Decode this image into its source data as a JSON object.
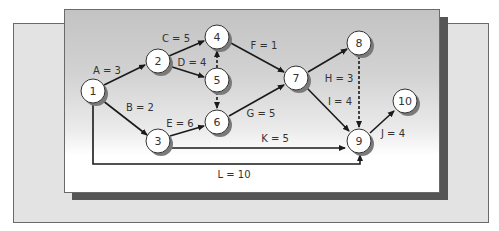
{
  "diagram": {
    "type": "activity-on-arrow network",
    "colors": {
      "front_panel_top": "#c3c3c3",
      "front_panel_bottom": "#ffffff",
      "back_panel": "#e3e3e3",
      "shadow": "#555555",
      "edge": "#1a1a1a"
    },
    "nodes": [
      {
        "id": "1",
        "label": "1",
        "x": 93,
        "y": 91
      },
      {
        "id": "2",
        "label": "2",
        "x": 158,
        "y": 61
      },
      {
        "id": "3",
        "label": "3",
        "x": 158,
        "y": 141
      },
      {
        "id": "4",
        "label": "4",
        "x": 217,
        "y": 37
      },
      {
        "id": "5",
        "label": "5",
        "x": 217,
        "y": 80
      },
      {
        "id": "6",
        "label": "6",
        "x": 217,
        "y": 122
      },
      {
        "id": "7",
        "label": "7",
        "x": 296,
        "y": 78
      },
      {
        "id": "8",
        "label": "8",
        "x": 359,
        "y": 43
      },
      {
        "id": "9",
        "label": "9",
        "x": 359,
        "y": 141
      },
      {
        "id": "10",
        "label": "10",
        "x": 405,
        "y": 101
      }
    ],
    "activities": [
      {
        "name": "A",
        "duration": 3,
        "label": "A = 3",
        "from": "1",
        "to": "2",
        "dummy": false
      },
      {
        "name": "B",
        "duration": 2,
        "label": "B = 2",
        "from": "1",
        "to": "3",
        "dummy": false
      },
      {
        "name": "C",
        "duration": 5,
        "label": "C = 5",
        "from": "2",
        "to": "4",
        "dummy": false
      },
      {
        "name": "D",
        "duration": 4,
        "label": "D = 4",
        "from": "2",
        "to": "5",
        "dummy": false
      },
      {
        "name": "E",
        "duration": 6,
        "label": "E = 6",
        "from": "3",
        "to": "6",
        "dummy": false
      },
      {
        "name": "F",
        "duration": 1,
        "label": "F = 1",
        "from": "4",
        "to": "7",
        "dummy": false
      },
      {
        "name": "G",
        "duration": 5,
        "label": "G = 5",
        "from": "6",
        "to": "7",
        "dummy": false
      },
      {
        "name": "H",
        "duration": 3,
        "label": "H = 3",
        "from": "7",
        "to": "8",
        "dummy": false
      },
      {
        "name": "I",
        "duration": 4,
        "label": "I = 4",
        "from": "7",
        "to": "9",
        "dummy": false
      },
      {
        "name": "J",
        "duration": 4,
        "label": "J = 4",
        "from": "9",
        "to": "10",
        "dummy": false
      },
      {
        "name": "K",
        "duration": 5,
        "label": "K = 5",
        "from": "3",
        "to": "9",
        "dummy": false
      },
      {
        "name": "L",
        "duration": 10,
        "label": "L = 10",
        "from": "1",
        "to": "9",
        "dummy": false
      }
    ],
    "dummy_activities": [
      {
        "from": "5",
        "to": "4"
      },
      {
        "from": "5",
        "to": "6"
      },
      {
        "from": "8",
        "to": "9"
      }
    ]
  }
}
